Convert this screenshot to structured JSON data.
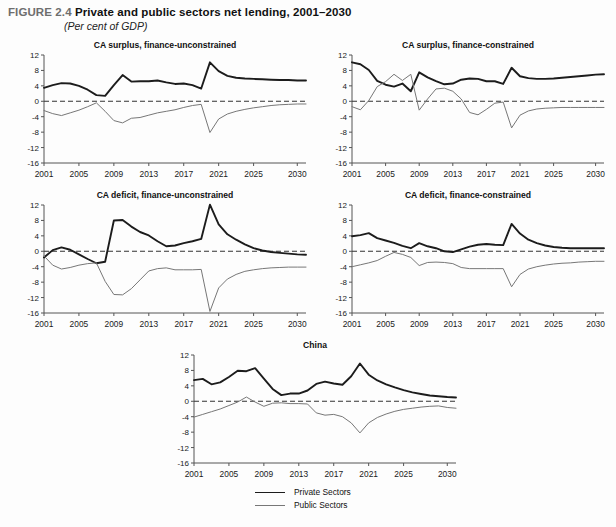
{
  "figure": {
    "number": "FIGURE 2.4",
    "title": "Private and public sectors net lending, 2001–2030",
    "subtitle": "(Per cent of GDP)"
  },
  "legend": {
    "items": [
      {
        "label": "Private Sectors",
        "color": "#1c1c1c"
      },
      {
        "label": "Public Sectors",
        "color": "#777777"
      }
    ]
  },
  "chart_data": [
    {
      "type": "line",
      "title": "CA surplus, finance-unconstrained",
      "xlabel": "",
      "ylabel": "",
      "xlim": [
        2001,
        2031
      ],
      "ylim": [
        -16,
        12
      ],
      "yticks": [
        12,
        8,
        4,
        0,
        -4,
        -8,
        -12,
        -16
      ],
      "xticks": [
        2001,
        2005,
        2009,
        2013,
        2017,
        2021,
        2025,
        2030
      ],
      "grid": false,
      "zero_line": true,
      "legend_position": "below-figure",
      "x": [
        2001,
        2002,
        2003,
        2004,
        2005,
        2006,
        2007,
        2008,
        2009,
        2010,
        2011,
        2012,
        2013,
        2014,
        2015,
        2016,
        2017,
        2018,
        2019,
        2020,
        2021,
        2022,
        2023,
        2024,
        2025,
        2026,
        2027,
        2028,
        2029,
        2030,
        2031
      ],
      "series": [
        {
          "name": "Private Sectors",
          "values": [
            3.5,
            4.2,
            4.7,
            4.6,
            4.0,
            3.0,
            1.6,
            1.4,
            4.2,
            6.8,
            5.1,
            5.2,
            5.2,
            5.4,
            4.9,
            4.5,
            4.6,
            4.2,
            3.3,
            10.1,
            7.8,
            6.6,
            6.1,
            5.9,
            5.8,
            5.7,
            5.6,
            5.5,
            5.5,
            5.4,
            5.4
          ]
        },
        {
          "name": "Public Sectors",
          "values": [
            -2.4,
            -3.2,
            -3.7,
            -3.0,
            -2.3,
            -1.4,
            -0.4,
            -2.6,
            -5.0,
            -5.6,
            -4.4,
            -4.2,
            -3.6,
            -3.0,
            -2.6,
            -2.2,
            -1.6,
            -1.1,
            -0.8,
            -8.1,
            -4.6,
            -3.3,
            -2.6,
            -2.1,
            -1.7,
            -1.4,
            -1.1,
            -0.9,
            -0.8,
            -0.7,
            -0.7
          ]
        }
      ]
    },
    {
      "type": "line",
      "title": "CA surplus, finance-constrained",
      "xlabel": "",
      "ylabel": "",
      "xlim": [
        2001,
        2031
      ],
      "ylim": [
        -16,
        12
      ],
      "yticks": [
        12,
        8,
        4,
        0,
        -4,
        -8,
        -12,
        -16
      ],
      "xticks": [
        2001,
        2005,
        2009,
        2013,
        2017,
        2021,
        2025,
        2030
      ],
      "grid": false,
      "zero_line": true,
      "x": [
        2001,
        2002,
        2003,
        2004,
        2005,
        2006,
        2007,
        2008,
        2009,
        2010,
        2011,
        2012,
        2013,
        2014,
        2015,
        2016,
        2017,
        2018,
        2019,
        2020,
        2021,
        2022,
        2023,
        2024,
        2025,
        2026,
        2027,
        2028,
        2029,
        2030,
        2031
      ],
      "series": [
        {
          "name": "Private Sectors",
          "values": [
            10.1,
            9.6,
            8.1,
            5.3,
            4.3,
            3.8,
            4.6,
            2.6,
            7.5,
            6.2,
            5.2,
            4.4,
            4.6,
            5.6,
            5.9,
            5.8,
            5.2,
            5.2,
            4.5,
            8.7,
            6.5,
            6.0,
            5.8,
            5.8,
            5.9,
            6.1,
            6.3,
            6.5,
            6.7,
            6.9,
            7.0
          ]
        },
        {
          "name": "Public Sectors",
          "values": [
            -1.4,
            -2.2,
            0.2,
            3.8,
            5.1,
            7.0,
            5.4,
            7.0,
            -2.3,
            0.6,
            3.2,
            3.4,
            2.6,
            0.6,
            -2.9,
            -3.5,
            -2.1,
            -0.5,
            -0.2,
            -6.9,
            -3.6,
            -2.5,
            -2.0,
            -1.8,
            -1.7,
            -1.6,
            -1.6,
            -1.6,
            -1.6,
            -1.6,
            -1.6
          ]
        }
      ]
    },
    {
      "type": "line",
      "title": "CA deficit, finance-unconstrained",
      "xlabel": "",
      "ylabel": "",
      "xlim": [
        2001,
        2031
      ],
      "ylim": [
        -16,
        12
      ],
      "yticks": [
        12,
        8,
        4,
        0,
        -4,
        -8,
        -12,
        -16
      ],
      "xticks": [
        2001,
        2005,
        2009,
        2013,
        2017,
        2021,
        2025,
        2030
      ],
      "grid": false,
      "zero_line": true,
      "x": [
        2001,
        2002,
        2003,
        2004,
        2005,
        2006,
        2007,
        2008,
        2009,
        2010,
        2011,
        2012,
        2013,
        2014,
        2015,
        2016,
        2017,
        2018,
        2019,
        2020,
        2021,
        2022,
        2023,
        2024,
        2025,
        2026,
        2027,
        2028,
        2029,
        2030,
        2031
      ],
      "series": [
        {
          "name": "Private Sectors",
          "values": [
            -1.6,
            0.3,
            1.0,
            0.4,
            -0.8,
            -2.0,
            -3.1,
            -2.7,
            8.0,
            8.1,
            6.4,
            5.0,
            4.1,
            2.6,
            1.3,
            1.5,
            2.1,
            2.6,
            3.2,
            12.1,
            7.0,
            4.4,
            3.0,
            1.8,
            0.8,
            0.2,
            -0.2,
            -0.4,
            -0.6,
            -0.8,
            -0.9
          ]
        },
        {
          "name": "Public Sectors",
          "values": [
            -1.2,
            -3.6,
            -4.6,
            -4.2,
            -3.6,
            -3.2,
            -3.0,
            -7.8,
            -11.2,
            -11.3,
            -9.7,
            -7.4,
            -5.1,
            -4.5,
            -4.3,
            -4.8,
            -4.8,
            -4.8,
            -4.7,
            -15.6,
            -9.5,
            -7.2,
            -6.0,
            -5.2,
            -4.8,
            -4.5,
            -4.3,
            -4.2,
            -4.1,
            -4.1,
            -4.1
          ]
        }
      ]
    },
    {
      "type": "line",
      "title": "CA deficit, finance-constrained",
      "xlabel": "",
      "ylabel": "",
      "xlim": [
        2001,
        2031
      ],
      "ylim": [
        -16,
        12
      ],
      "yticks": [
        12,
        8,
        4,
        0,
        -4,
        -8,
        -12,
        -16
      ],
      "xticks": [
        2001,
        2005,
        2009,
        2013,
        2017,
        2021,
        2025,
        2030
      ],
      "grid": false,
      "zero_line": true,
      "x": [
        2001,
        2002,
        2003,
        2004,
        2005,
        2006,
        2007,
        2008,
        2009,
        2010,
        2011,
        2012,
        2013,
        2014,
        2015,
        2016,
        2017,
        2018,
        2019,
        2020,
        2021,
        2022,
        2023,
        2024,
        2025,
        2026,
        2027,
        2028,
        2029,
        2030,
        2031
      ],
      "series": [
        {
          "name": "Private Sectors",
          "values": [
            3.9,
            4.2,
            4.7,
            3.4,
            2.8,
            2.2,
            1.4,
            0.8,
            2.1,
            1.3,
            0.8,
            0.0,
            -0.2,
            0.5,
            1.2,
            1.7,
            1.9,
            1.7,
            1.6,
            7.1,
            4.6,
            3.0,
            2.1,
            1.5,
            1.1,
            0.9,
            0.8,
            0.8,
            0.8,
            0.8,
            0.8
          ]
        },
        {
          "name": "Public Sectors",
          "values": [
            -4.0,
            -3.5,
            -3.0,
            -2.4,
            -1.3,
            -0.3,
            -0.8,
            -1.6,
            -3.7,
            -2.9,
            -2.8,
            -2.9,
            -3.2,
            -4.2,
            -4.5,
            -4.5,
            -4.5,
            -4.5,
            -4.5,
            -9.2,
            -6.0,
            -4.6,
            -4.0,
            -3.6,
            -3.3,
            -3.1,
            -3.0,
            -2.8,
            -2.7,
            -2.6,
            -2.6
          ]
        }
      ]
    },
    {
      "type": "line",
      "title": "China",
      "xlabel": "",
      "ylabel": "",
      "xlim": [
        2001,
        2031
      ],
      "ylim": [
        -16,
        12
      ],
      "yticks": [
        12,
        8,
        4,
        0,
        -4,
        -8,
        -12,
        -16
      ],
      "xticks": [
        2001,
        2005,
        2009,
        2013,
        2017,
        2021,
        2025,
        2030
      ],
      "grid": false,
      "zero_line": true,
      "x": [
        2001,
        2002,
        2003,
        2004,
        2005,
        2006,
        2007,
        2008,
        2009,
        2010,
        2011,
        2012,
        2013,
        2014,
        2015,
        2016,
        2017,
        2018,
        2019,
        2020,
        2021,
        2022,
        2023,
        2024,
        2025,
        2026,
        2027,
        2028,
        2029,
        2030,
        2031
      ],
      "series": [
        {
          "name": "Private Sectors",
          "values": [
            5.5,
            5.8,
            4.4,
            4.9,
            6.3,
            7.9,
            7.8,
            8.6,
            5.9,
            3.2,
            1.6,
            2.0,
            2.0,
            2.8,
            4.5,
            5.1,
            4.6,
            4.3,
            6.5,
            9.8,
            6.9,
            5.4,
            4.4,
            3.6,
            2.9,
            2.3,
            1.9,
            1.5,
            1.3,
            1.1,
            1.0
          ]
        },
        {
          "name": "Public Sectors",
          "values": [
            -4.1,
            -3.4,
            -2.7,
            -2.0,
            -1.1,
            -0.2,
            1.1,
            -0.2,
            -1.3,
            -0.5,
            -0.4,
            -0.6,
            -0.6,
            -0.7,
            -3.0,
            -3.6,
            -3.4,
            -4.0,
            -5.6,
            -8.2,
            -5.6,
            -4.2,
            -3.3,
            -2.6,
            -2.1,
            -1.8,
            -1.5,
            -1.3,
            -1.2,
            -1.6,
            -1.8
          ]
        }
      ]
    }
  ]
}
